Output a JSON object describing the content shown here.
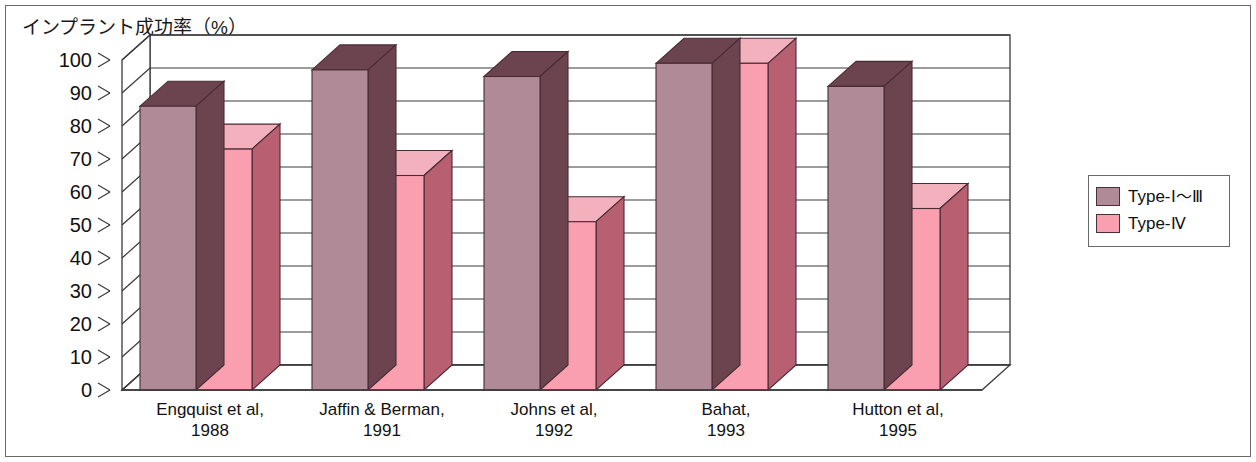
{
  "chart_data": {
    "type": "bar",
    "title": "インプラント成功率（%）",
    "xlabel": "",
    "ylabel": "インプラント成功率（%）",
    "ylim": [
      0,
      100
    ],
    "yticks": [
      0,
      10,
      20,
      30,
      40,
      50,
      60,
      70,
      80,
      90,
      100
    ],
    "grid": true,
    "legend_position": "right",
    "style": "3d-clustered-column",
    "categories": [
      "Engquist et al,\n1988",
      "Jaffin & Berman,\n1991",
      "Johns et al,\n1992",
      "Bahat,\n1993",
      "Hutton et al,\n1995"
    ],
    "category_lines": [
      [
        "Engquist et al,",
        "1988"
      ],
      [
        "Jaffin & Berman,",
        "1991"
      ],
      [
        "Johns et al,",
        "1992"
      ],
      [
        "Bahat,",
        "1993"
      ],
      [
        "Hutton et al,",
        "1995"
      ]
    ],
    "series": [
      {
        "name": "Type-Ⅰ～Ⅲ",
        "values": [
          86,
          97,
          95,
          99,
          92
        ],
        "color": "#b08a96"
      },
      {
        "name": "Type-Ⅳ",
        "values": [
          73,
          65,
          51,
          99,
          55
        ],
        "color": "#f99fb0"
      }
    ]
  },
  "legend": {
    "items": [
      {
        "label_prefix": "Type-",
        "label_roman": "Ⅰ～Ⅲ",
        "full": "Type-Ⅰ～Ⅲ",
        "color": "#b08a96"
      },
      {
        "label_prefix": "Type-",
        "label_roman": "Ⅳ",
        "full": "Type-Ⅳ",
        "color": "#f99fb0"
      }
    ]
  },
  "colors": {
    "series1_front": "#b08a96",
    "series1_top": "#6b4450",
    "series1_side": "#6b4450",
    "series2_front": "#f99fb0",
    "series2_top": "#f3b0bd",
    "series2_side": "#b85f72",
    "grid": "#3a3a3a",
    "frame": "#6a6a6a",
    "text": "#111111"
  }
}
